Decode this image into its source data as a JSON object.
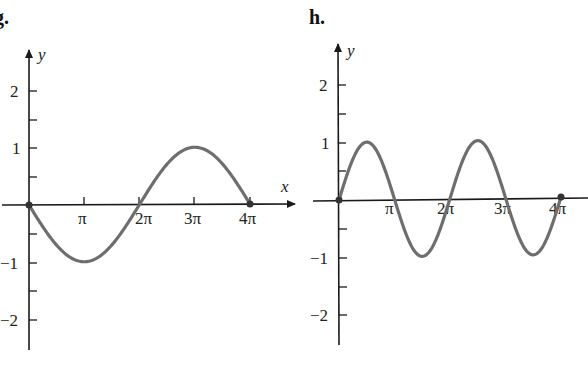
{
  "panels": [
    {
      "label": "g.",
      "xlabel": "x",
      "ylabel": "y"
    },
    {
      "label": "h.",
      "xlabel": "",
      "ylabel": "y"
    }
  ],
  "colors": {
    "curve": "#6e6e6e",
    "axis": "#1a1a1a",
    "text": "#222222"
  },
  "chart_data": [
    {
      "type": "line",
      "title": "g.",
      "function": "y = -2 sin(x/2)",
      "xlabel": "x",
      "ylabel": "y",
      "x_ticks": [
        "π",
        "2π",
        "3π",
        "4π"
      ],
      "y_ticks": [
        "2",
        "1",
        "-1",
        "-2"
      ],
      "xlim": [
        0,
        "4π"
      ],
      "ylim": [
        -2.5,
        2.5
      ],
      "grid": false,
      "points": [
        {
          "x": "0",
          "y": 0
        },
        {
          "x": "π",
          "y": -2
        },
        {
          "x": "2π",
          "y": 0
        },
        {
          "x": "3π",
          "y": 2
        },
        {
          "x": "4π",
          "y": 0
        }
      ],
      "endpoints_marked": [
        "0",
        "4π"
      ]
    },
    {
      "type": "line",
      "title": "h.",
      "function": "y = 2 sin(x)",
      "xlabel": "",
      "ylabel": "y",
      "x_ticks": [
        "π",
        "2π",
        "3π",
        "4π"
      ],
      "y_ticks": [
        "2",
        "1",
        "-1",
        "-2"
      ],
      "xlim": [
        0,
        "4π"
      ],
      "ylim": [
        -2.5,
        2.5
      ],
      "grid": false,
      "points": [
        {
          "x": "0",
          "y": 0
        },
        {
          "x": "π/2",
          "y": 2
        },
        {
          "x": "π",
          "y": 0
        },
        {
          "x": "3π/2",
          "y": -2
        },
        {
          "x": "2π",
          "y": 0
        },
        {
          "x": "5π/2",
          "y": 2
        },
        {
          "x": "3π",
          "y": 0
        },
        {
          "x": "7π/2",
          "y": -2
        },
        {
          "x": "4π",
          "y": 0
        }
      ],
      "endpoints_marked": [
        "0",
        "4π"
      ]
    }
  ]
}
